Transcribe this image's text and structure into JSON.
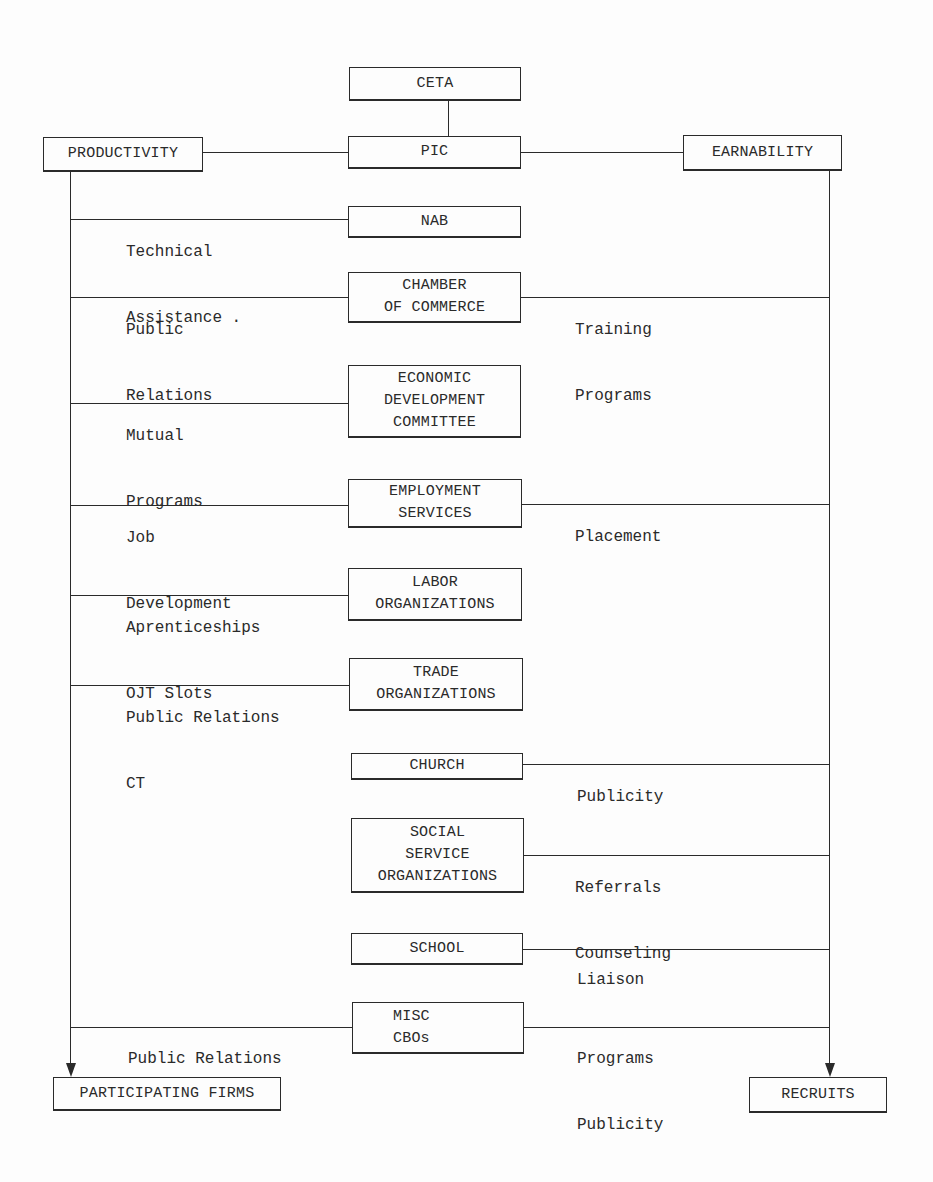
{
  "diagram": {
    "top": {
      "ceta": [
        "CETA"
      ],
      "pic": [
        "PIC"
      ],
      "productivity": [
        "PRODUCTIVITY"
      ],
      "earnability": [
        "EARNABILITY"
      ]
    },
    "nodes": [
      {
        "id": "nab",
        "lines": [
          "NAB"
        ]
      },
      {
        "id": "chamber-of-commerce",
        "lines": [
          "CHAMBER",
          "OF COMMERCE"
        ]
      },
      {
        "id": "economic-development-committee",
        "lines": [
          "ECONOMIC",
          "DEVELOPMENT",
          "COMMITTEE"
        ]
      },
      {
        "id": "employment-services",
        "lines": [
          "EMPLOYMENT",
          "SERVICES"
        ]
      },
      {
        "id": "labor-organizations",
        "lines": [
          "LABOR",
          "ORGANIZATIONS"
        ]
      },
      {
        "id": "trade-organizations",
        "lines": [
          "TRADE",
          "ORGANIZATIONS"
        ]
      },
      {
        "id": "church",
        "lines": [
          "CHURCH"
        ]
      },
      {
        "id": "social-service-organizations",
        "lines": [
          "SOCIAL",
          "SERVICE",
          "ORGANIZATIONS"
        ]
      },
      {
        "id": "school",
        "lines": [
          "SCHOOL"
        ]
      },
      {
        "id": "misc-cbos",
        "lines": [
          "MISC",
          "CBOs"
        ]
      }
    ],
    "left_labels": {
      "nab": [
        "Technical",
        "Assistance ."
      ],
      "chamber": [
        "Public",
        "Relations"
      ],
      "edc": [
        "Mutual",
        "Programs"
      ],
      "employment": [
        "Job",
        "Development"
      ],
      "labor": [
        "Aprenticeships",
        "OJT Slots"
      ],
      "trade": [
        "Public Relations",
        "CT"
      ],
      "misc": [
        "Public Relations"
      ]
    },
    "right_labels": {
      "chamber": [
        "Training",
        "Programs"
      ],
      "employment": [
        "Placement"
      ],
      "church": [
        "Publicity"
      ],
      "social": [
        "Referrals",
        "Counseling"
      ],
      "school": [
        "Liaison"
      ],
      "misc": [
        "Programs",
        "Publicity"
      ]
    },
    "outputs": {
      "participating_firms": [
        "PARTICIPATING FIRMS"
      ],
      "recruits": [
        "RECRUITS"
      ]
    }
  }
}
